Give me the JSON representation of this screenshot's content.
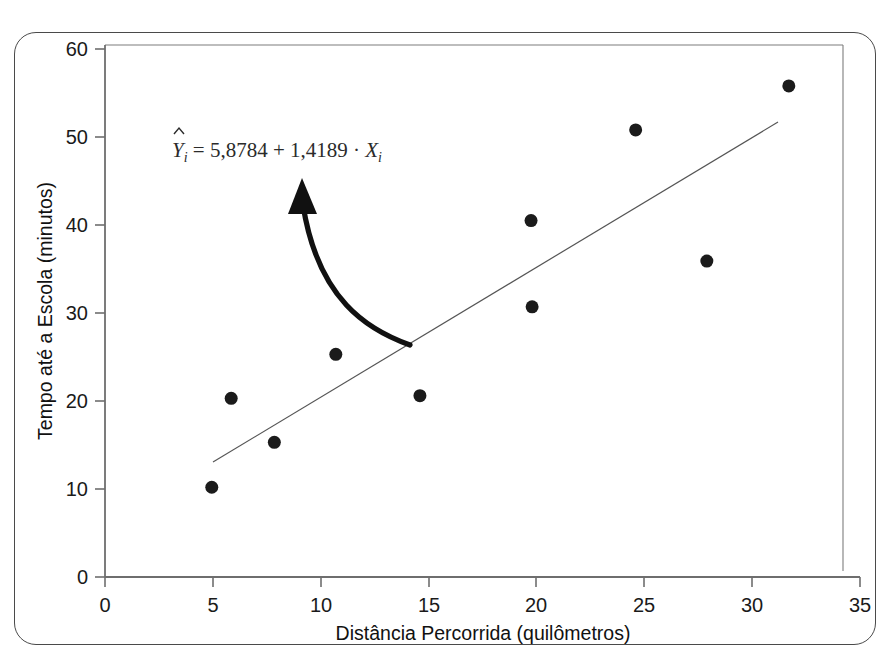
{
  "figure": {
    "frame_color": "#4a4a4a",
    "background": "#ffffff"
  },
  "chart_data": {
    "type": "scatter",
    "title": "",
    "xlabel": "Distância Percorrida (quilômetros)",
    "ylabel": "Tempo até a Escola (minutos)",
    "xlim": [
      0,
      35
    ],
    "ylim": [
      0,
      60
    ],
    "xticks": [
      0,
      5,
      10,
      15,
      20,
      25,
      30,
      35
    ],
    "yticks": [
      0,
      10,
      20,
      30,
      40,
      50,
      60
    ],
    "xtick_labels": [
      "0",
      "5",
      "10",
      "15",
      "20",
      "25",
      "30",
      "35"
    ],
    "ytick_labels": [
      "0",
      "10",
      "20",
      "30",
      "40",
      "50",
      "60"
    ],
    "grid": false,
    "legend": false,
    "marker_color": "#1b1b1b",
    "marker_size": 13,
    "points": [
      {
        "x": 4.95,
        "y": 10.2
      },
      {
        "x": 5.85,
        "y": 20.3
      },
      {
        "x": 7.85,
        "y": 15.3
      },
      {
        "x": 10.7,
        "y": 25.3
      },
      {
        "x": 14.6,
        "y": 20.6
      },
      {
        "x": 19.75,
        "y": 40.5
      },
      {
        "x": 19.8,
        "y": 30.7
      },
      {
        "x": 24.6,
        "y": 50.8
      },
      {
        "x": 27.9,
        "y": 35.9
      },
      {
        "x": 31.7,
        "y": 55.8
      }
    ],
    "trendline": {
      "intercept": 5.8784,
      "slope": 1.4189,
      "x_start": 5.0,
      "x_end": 31.2,
      "color": "#555555",
      "width": 1.2
    },
    "annotation": {
      "equation_parts": {
        "y_hat": "Y",
        "subscript_1": "i",
        "equals": " = ",
        "intercept": "5,8784",
        "plus": " + ",
        "slope": "1,4189",
        "dot": " · ",
        "x_var": "X",
        "subscript_2": "i"
      },
      "equation_full": "Ŷi = 5,8784 + 1,4189 · Xi",
      "arrow": {
        "tip_x": 9.25,
        "tip_y": 44.8,
        "tail_x": 14.1,
        "tail_y": 26.3,
        "color": "#111111"
      }
    }
  }
}
